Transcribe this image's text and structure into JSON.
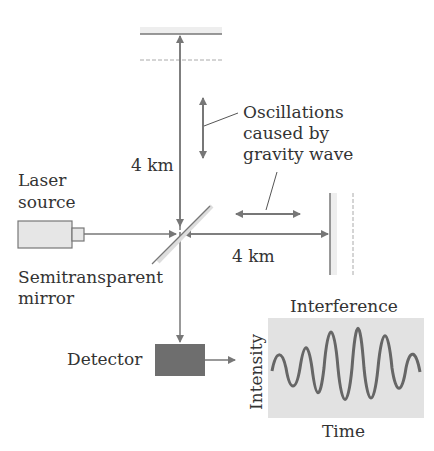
{
  "labels": {
    "arm_vertical": "4 km",
    "arm_horizontal": "4 km",
    "oscillation_line1": "Oscillations",
    "oscillation_line2": "caused by",
    "oscillation_line3": "gravity wave",
    "laser_line1": "Laser",
    "laser_line2": "source",
    "mirror_line1": "Semitransparent",
    "mirror_line2": "mirror",
    "detector": "Detector",
    "plot_title": "Interference",
    "plot_ylabel": "Intensity",
    "plot_xlabel": "Time"
  },
  "colors": {
    "line": "#777777",
    "text": "#333333",
    "detector": "#6e6e6e",
    "laser_fill": "#e6e6e6",
    "plot_bg": "#e2e2e2",
    "wave": "#666666"
  }
}
